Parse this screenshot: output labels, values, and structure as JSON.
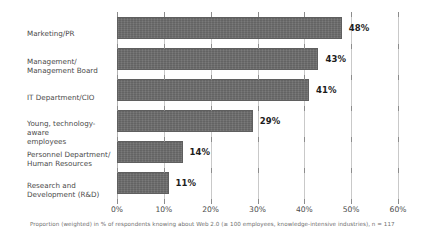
{
  "chart_data": {
    "type": "bar",
    "orientation": "horizontal",
    "title": "",
    "xlabel": "",
    "ylabel": "",
    "xlim": [
      0,
      60
    ],
    "grid": true,
    "legend": false,
    "categories": [
      "Marketing/PR",
      "Management/\nManagement Board",
      "IT Department/CIO",
      "Young, technology-aware\nemployees",
      "Personnel Department/\nHuman Resources",
      "Research and\nDevelopment (R&D)"
    ],
    "values": [
      48,
      43,
      41,
      29,
      14,
      11
    ],
    "value_labels": [
      "48%",
      "43%",
      "41%",
      "29%",
      "14%",
      "11%"
    ],
    "xticks": [
      0,
      10,
      20,
      30,
      40,
      50,
      60
    ],
    "xtick_labels": [
      "0%",
      "10%",
      "20%",
      "30%",
      "40%",
      "50%",
      "60%"
    ],
    "footnote": "Proportion (weighted) in % of respondents knowing about Web 2.0 (≥ 100 employees, knowledge-intensive industries), n = 117",
    "bar_color": "#6d6d6d",
    "grid_color": "#c9c9c9",
    "background": "#ffffff"
  }
}
